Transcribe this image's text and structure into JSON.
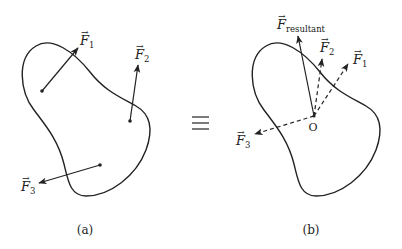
{
  "figure": {
    "equivalence_symbol": "≡",
    "panels": [
      {
        "id": "a",
        "caption": "(a)",
        "forces": [
          {
            "name": "F",
            "subscript": "1",
            "style": "solid",
            "from": [
              42,
              91
            ],
            "to": [
              78,
              48
            ],
            "label_pos": [
              79,
              45
            ]
          },
          {
            "name": "F",
            "subscript": "2",
            "style": "solid",
            "from": [
              130,
              121
            ],
            "to": [
              138,
              65
            ],
            "label_pos": [
              134,
              59
            ]
          },
          {
            "name": "F",
            "subscript": "3",
            "style": "solid",
            "from": [
              100,
              165
            ],
            "to": [
              39,
              183
            ],
            "label_pos": [
              20,
              191
            ]
          }
        ]
      },
      {
        "id": "b",
        "caption": "(b)",
        "origin_label": "O",
        "forces": [
          {
            "name": "F",
            "subscript": "resultant",
            "style": "solid",
            "from": [
              314,
              116
            ],
            "to": [
              298,
              36
            ],
            "label_pos": [
              276,
              29
            ]
          },
          {
            "name": "F",
            "subscript": "2",
            "style": "dashed",
            "from": [
              314,
              116
            ],
            "to": [
              322,
              59
            ],
            "label_pos": [
              319,
              52
            ]
          },
          {
            "name": "F",
            "subscript": "1",
            "style": "dashed",
            "from": [
              314,
              116
            ],
            "to": [
              348,
              64
            ],
            "label_pos": [
              352,
              64
            ]
          },
          {
            "name": "F",
            "subscript": "3",
            "style": "dashed",
            "from": [
              314,
              116
            ],
            "to": [
              255,
              134
            ],
            "label_pos": [
              235,
              145
            ]
          }
        ]
      }
    ]
  }
}
